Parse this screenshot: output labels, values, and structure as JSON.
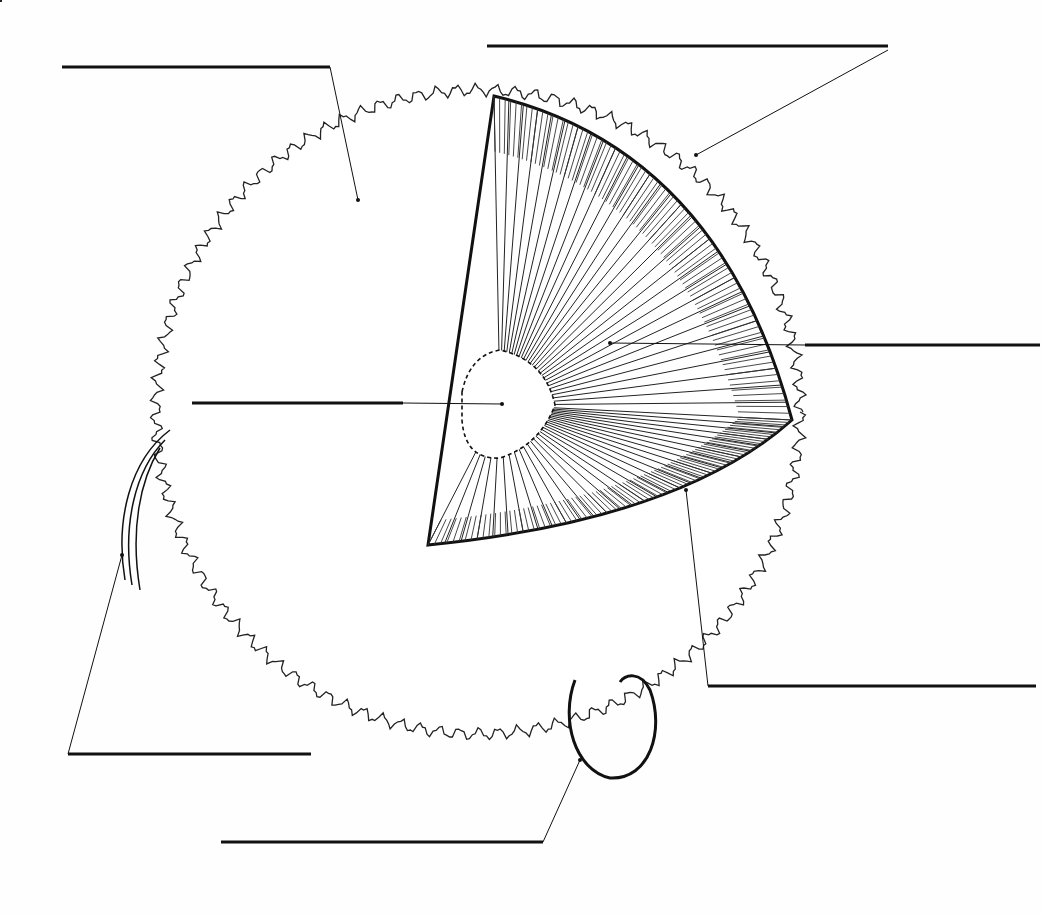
{
  "diagram": {
    "title": "",
    "sun": {
      "cx": 478,
      "cy": 412,
      "r": 322
    },
    "cutaway": {
      "apex": [
        428,
        545
      ],
      "top": [
        494,
        96
      ],
      "right": [
        792,
        420
      ],
      "core_r": 120
    },
    "labels": [
      {
        "name": "label-blank-sunspot",
        "line": [
          62,
          67,
          330,
          67
        ],
        "leader": [
          330,
          67,
          358,
          200
        ]
      },
      {
        "name": "label-blank-corona",
        "line": [
          487,
          46,
          888,
          46
        ],
        "leader": [
          888,
          50,
          696,
          155
        ]
      },
      {
        "name": "label-blank-radiative-zone",
        "line": [
          805,
          345,
          1040,
          345
        ],
        "leader": [
          805,
          345,
          610,
          343
        ]
      },
      {
        "name": "label-blank-core",
        "line": [
          192,
          403,
          403,
          403
        ],
        "leader": [
          403,
          403,
          502,
          404
        ]
      },
      {
        "name": "label-blank-convection-zone",
        "line": [
          708,
          686,
          1036,
          686
        ],
        "leader": [
          708,
          686,
          686,
          490
        ]
      },
      {
        "name": "label-blank-solar-prominence",
        "line": [
          68,
          754,
          311,
          754
        ],
        "leader": [
          68,
          754,
          122,
          555
        ]
      },
      {
        "name": "label-blank-solar-flare",
        "line": [
          221,
          842,
          543,
          842
        ],
        "leader": [
          543,
          842,
          580,
          760
        ]
      }
    ],
    "sunspots": [
      [
        358,
        212
      ],
      [
        340,
        250
      ],
      [
        346,
        282
      ],
      [
        185,
        330
      ],
      [
        290,
        445
      ],
      [
        230,
        500
      ],
      [
        408,
        570
      ],
      [
        365,
        608
      ],
      [
        320,
        683
      ],
      [
        400,
        686
      ],
      [
        720,
        550
      ],
      [
        745,
        525
      ],
      [
        775,
        487
      ],
      [
        683,
        658
      ],
      [
        393,
        112
      ],
      [
        567,
        663
      ],
      [
        625,
        680
      ]
    ]
  }
}
